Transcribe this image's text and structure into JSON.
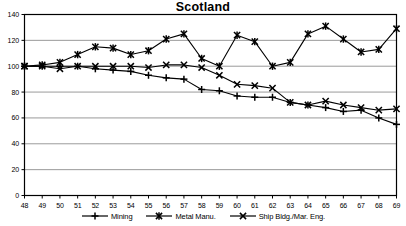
{
  "chart_data": {
    "type": "line",
    "title": "Scotland",
    "xlabel": "",
    "ylabel": "",
    "xlim": [
      48,
      69
    ],
    "ylim": [
      0,
      140
    ],
    "ytick_step": 20,
    "grid": true,
    "legend_position": "bottom",
    "categories": [
      "48",
      "49",
      "50",
      "51",
      "52",
      "53",
      "54",
      "55",
      "56",
      "57",
      "58",
      "59",
      "60",
      "61",
      "62",
      "63",
      "64",
      "65",
      "66",
      "67",
      "68",
      "69"
    ],
    "yticks": [
      "0",
      "20",
      "40",
      "60",
      "80",
      "100",
      "120",
      "140"
    ],
    "series": [
      {
        "name": "Mining",
        "marker": "plus",
        "color": "#000000",
        "values": [
          100,
          100,
          100,
          100,
          98,
          97,
          96,
          93,
          91,
          90,
          82,
          81,
          77,
          76,
          76,
          72,
          70,
          68,
          65,
          66,
          60,
          55
        ]
      },
      {
        "name": "Metal Manu.",
        "marker": "asterisk",
        "color": "#000000",
        "values": [
          100,
          101,
          103,
          109,
          115,
          114,
          109,
          112,
          121,
          125,
          106,
          100,
          124,
          119,
          100,
          103,
          125,
          131,
          121,
          111,
          113,
          129
        ]
      },
      {
        "name": "Ship Bldg./Mar. Eng.",
        "marker": "cross",
        "color": "#000000",
        "values": [
          100,
          100,
          98,
          100,
          100,
          100,
          100,
          99,
          101,
          101,
          99,
          93,
          86,
          85,
          83,
          72,
          70,
          73,
          70,
          68,
          66,
          67
        ]
      }
    ]
  },
  "legend": {
    "items": [
      {
        "label": "Mining",
        "marker": "plus"
      },
      {
        "label": "Metal Manu.",
        "marker": "asterisk"
      },
      {
        "label": "Ship Bldg./Mar. Eng.",
        "marker": "cross"
      }
    ]
  }
}
